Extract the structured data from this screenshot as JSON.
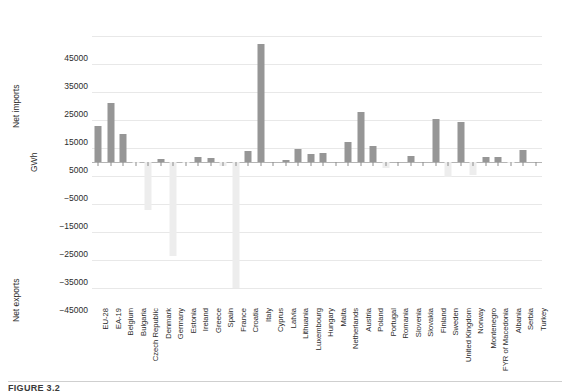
{
  "figure": {
    "caption_partial": "FIGURE 3.2"
  },
  "axes": {
    "y_title_top": "Net imports",
    "y_title_unit": "GWh",
    "y_title_bottom": "Net exports",
    "y_ticks": [
      "45000",
      "35000",
      "25000",
      "15000",
      "5000",
      "−5000",
      "−15000",
      "−25000",
      "−35000",
      "−45000"
    ]
  },
  "chart_data": {
    "type": "bar",
    "title": "",
    "xlabel": "",
    "ylabel": "GWh",
    "ylim": [
      -50000,
      50000
    ],
    "ytick_values": [
      45000,
      35000,
      25000,
      15000,
      5000,
      -5000,
      -15000,
      -25000,
      -35000,
      -45000
    ],
    "grid": true,
    "legend": "none",
    "note": "Positive values = net imports (dark grey bars). Negative values = net exports (light grey bars).",
    "categories": [
      "EU-28",
      "EA-19",
      "Belgium",
      "Bulgaria",
      "Czech Republic",
      "Denmark",
      "Germany",
      "Estonia",
      "Ireland",
      "Greece",
      "Spain",
      "France",
      "Croatia",
      "Italy",
      "Cyprus",
      "Latvia",
      "Lithuania",
      "Luxembourg",
      "Hungary",
      "Malta",
      "Netherlands",
      "Austria",
      "Poland",
      "Portugal",
      "Romania",
      "Slovenia",
      "Slovakia",
      "Finland",
      "Sweden",
      "United Kingdom",
      "Norway",
      "Montenegro",
      "FYR of Macedonia",
      "Albania",
      "Serbia",
      "Turkey"
    ],
    "values": [
      12800,
      21000,
      10000,
      -400,
      -17000,
      1200,
      -33500,
      -400,
      1800,
      1600,
      -1500,
      -45000,
      3800,
      42000,
      0,
      600,
      4600,
      2900,
      3100,
      0,
      7200,
      17800,
      5600,
      -2200,
      0,
      2100,
      0,
      15300,
      -5200,
      14200,
      -4500,
      1800,
      1800,
      -300,
      4300,
      0
    ]
  },
  "colors": {
    "bar_positive": "#969696",
    "bar_negative": "#ededed",
    "gridline": "#e8e8e8",
    "zeroline": "#b4b4b4",
    "text": "#2b2b2b"
  }
}
